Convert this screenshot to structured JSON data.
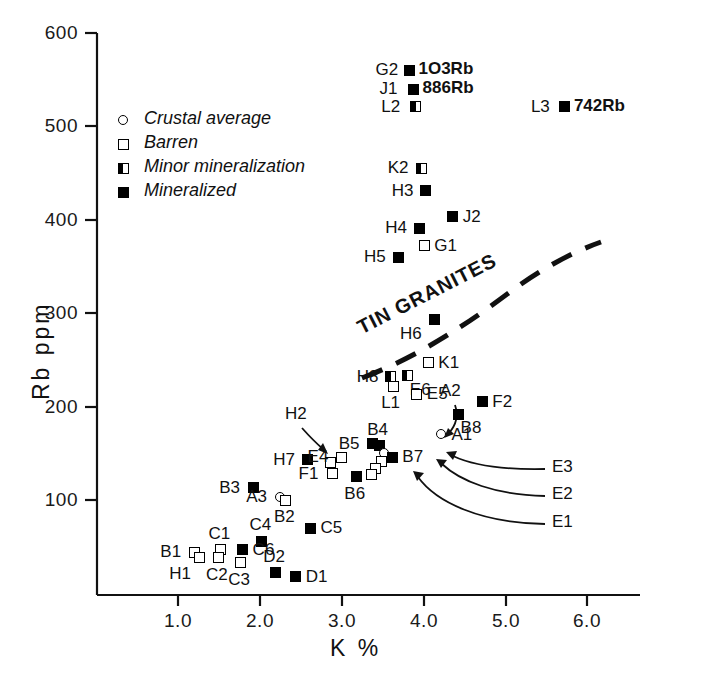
{
  "chart_data": {
    "type": "scatter",
    "title": "",
    "xlabel": "K %",
    "ylabel": "Rb ppm",
    "xlim": [
      0.55,
      6.4
    ],
    "ylim": [
      8,
      600
    ],
    "xticks": [
      1.0,
      2.0,
      3.0,
      4.0,
      5.0,
      6.0
    ],
    "xticklabels": [
      "1.0",
      "2.0",
      "3.0",
      "4.0",
      "5.0",
      "6.0"
    ],
    "yticks": [
      100,
      200,
      300,
      400,
      500,
      600
    ],
    "yticklabels": [
      "100",
      "200",
      "300",
      "400",
      "500",
      "600"
    ],
    "grid": false,
    "legend_position": "upper-left-inside",
    "legend": [
      {
        "key": "crustal",
        "marker": "open-circle",
        "label": "Crustal average"
      },
      {
        "key": "barren",
        "marker": "open-square",
        "label": "Barren"
      },
      {
        "key": "minor",
        "marker": "half-filled-square",
        "label": "Minor mineralization"
      },
      {
        "key": "mineralized",
        "marker": "filled-square",
        "label": "Mineralized"
      }
    ],
    "annotations": [
      {
        "name": "tin-granites-curve-label",
        "text": "TIN  GRANITES",
        "type": "curve-label"
      },
      {
        "name": "tin-granites-boundary",
        "text": "",
        "type": "dashed-curve"
      }
    ],
    "points": [
      {
        "id": "G2",
        "x": 3.83,
        "y": 560,
        "cat": "mineralized",
        "label": "G2",
        "lpos": "left",
        "value": "1O3Rb"
      },
      {
        "id": "J1",
        "x": 3.88,
        "y": 540,
        "cat": "mineralized",
        "label": "J1",
        "lpos": "left",
        "value": "886Rb"
      },
      {
        "id": "L2",
        "x": 3.9,
        "y": 521,
        "cat": "minor",
        "label": "L2",
        "lpos": "left",
        "value": ""
      },
      {
        "id": "L3",
        "x": 5.73,
        "y": 521,
        "cat": "mineralized",
        "label": "L3",
        "lpos": "left",
        "value": "742Rb"
      },
      {
        "id": "K2",
        "x": 3.98,
        "y": 455,
        "cat": "minor",
        "label": "K2",
        "lpos": "left",
        "value": ""
      },
      {
        "id": "H3",
        "x": 4.03,
        "y": 431,
        "cat": "mineralized",
        "label": "H3",
        "lpos": "left",
        "value": ""
      },
      {
        "id": "J2",
        "x": 4.36,
        "y": 403,
        "cat": "mineralized",
        "label": "J2",
        "lpos": "right",
        "value": ""
      },
      {
        "id": "H4",
        "x": 3.95,
        "y": 391,
        "cat": "mineralized",
        "label": "H4",
        "lpos": "left",
        "value": ""
      },
      {
        "id": "G1",
        "x": 4.01,
        "y": 372,
        "cat": "barren",
        "label": "G1",
        "lpos": "right",
        "value": ""
      },
      {
        "id": "H5",
        "x": 3.69,
        "y": 360,
        "cat": "mineralized",
        "label": "H5",
        "lpos": "left",
        "value": ""
      },
      {
        "id": "H6",
        "x": 4.13,
        "y": 293,
        "cat": "mineralized",
        "label": "H6",
        "lpos": "below-left",
        "value": ""
      },
      {
        "id": "K1",
        "x": 4.06,
        "y": 247,
        "cat": "barren",
        "label": "K1",
        "lpos": "right",
        "value": ""
      },
      {
        "id": "H8",
        "x": 3.6,
        "y": 232,
        "cat": "minor",
        "label": "H8",
        "lpos": "left",
        "value": ""
      },
      {
        "id": "L1",
        "x": 3.63,
        "y": 222,
        "cat": "barren",
        "label": "L1",
        "lpos": "below",
        "value": ""
      },
      {
        "id": "E6",
        "x": 3.81,
        "y": 233,
        "cat": "minor",
        "label": "E6",
        "lpos": "below-right",
        "value": ""
      },
      {
        "id": "E5",
        "x": 3.92,
        "y": 213,
        "cat": "barren",
        "label": "E5",
        "lpos": "right",
        "value": ""
      },
      {
        "id": "F2",
        "x": 4.72,
        "y": 205,
        "cat": "mineralized",
        "label": "F2",
        "lpos": "right",
        "value": ""
      },
      {
        "id": "B8",
        "x": 4.43,
        "y": 192,
        "cat": "mineralized",
        "label": "B8",
        "lpos": "below-right",
        "value": ""
      },
      {
        "id": "A1",
        "x": 4.22,
        "y": 170,
        "cat": "crustal",
        "label": "A1",
        "lpos": "right",
        "value": ""
      },
      {
        "id": "B5",
        "x": 3.38,
        "y": 160,
        "cat": "mineralized",
        "label": "B5",
        "lpos": "left",
        "value": ""
      },
      {
        "id": "B4",
        "x": 3.46,
        "y": 158,
        "cat": "mineralized",
        "label": "B4",
        "lpos": "above",
        "value": ""
      },
      {
        "id": "A2",
        "x": 3.52,
        "y": 150,
        "cat": "crustal",
        "label": "A2",
        "lpos": "arrow",
        "value": ""
      },
      {
        "id": "B7",
        "x": 3.62,
        "y": 146,
        "cat": "mineralized",
        "label": "B7",
        "lpos": "right",
        "value": ""
      },
      {
        "id": "E3",
        "x": 3.49,
        "y": 141,
        "cat": "barren",
        "label": "E3",
        "lpos": "arrow",
        "value": ""
      },
      {
        "id": "E2",
        "x": 3.42,
        "y": 134,
        "cat": "barren",
        "label": "E2",
        "lpos": "arrow",
        "value": ""
      },
      {
        "id": "E1",
        "x": 3.36,
        "y": 127,
        "cat": "barren",
        "label": "E1",
        "lpos": "arrow",
        "value": ""
      },
      {
        "id": "H2",
        "x": 2.87,
        "y": 140,
        "cat": "barren",
        "label": "H2",
        "lpos": "arrow",
        "value": ""
      },
      {
        "id": "H7",
        "x": 2.58,
        "y": 143,
        "cat": "mineralized",
        "label": "H7",
        "lpos": "left",
        "value": ""
      },
      {
        "id": "E4",
        "x": 3.0,
        "y": 146,
        "cat": "barren",
        "label": "E4",
        "lpos": "left",
        "value": ""
      },
      {
        "id": "F1",
        "x": 2.89,
        "y": 128,
        "cat": "barren",
        "label": "F1",
        "lpos": "left",
        "value": ""
      },
      {
        "id": "B6",
        "x": 3.18,
        "y": 125,
        "cat": "mineralized",
        "label": "B6",
        "lpos": "below",
        "value": ""
      },
      {
        "id": "B3",
        "x": 1.92,
        "y": 113,
        "cat": "mineralized",
        "label": "B3",
        "lpos": "left",
        "value": ""
      },
      {
        "id": "A3",
        "x": 2.25,
        "y": 103,
        "cat": "crustal",
        "label": "A3",
        "lpos": "left",
        "value": ""
      },
      {
        "id": "B2",
        "x": 2.32,
        "y": 100,
        "cat": "barren",
        "label": "B2",
        "lpos": "below",
        "value": ""
      },
      {
        "id": "C5",
        "x": 2.62,
        "y": 70,
        "cat": "mineralized",
        "label": "C5",
        "lpos": "right",
        "value": ""
      },
      {
        "id": "C4",
        "x": 2.02,
        "y": 56,
        "cat": "mineralized",
        "label": "C4",
        "lpos": "above",
        "value": ""
      },
      {
        "id": "C1",
        "x": 1.52,
        "y": 47,
        "cat": "barren",
        "label": "C1",
        "lpos": "above",
        "value": ""
      },
      {
        "id": "C6",
        "x": 1.79,
        "y": 47,
        "cat": "mineralized",
        "label": "C6",
        "lpos": "right",
        "value": ""
      },
      {
        "id": "B1",
        "x": 1.2,
        "y": 44,
        "cat": "barren",
        "label": "B1",
        "lpos": "left",
        "value": ""
      },
      {
        "id": "H1",
        "x": 1.26,
        "y": 38,
        "cat": "barren",
        "label": "H1",
        "lpos": "below-left",
        "value": ""
      },
      {
        "id": "C2",
        "x": 1.49,
        "y": 38,
        "cat": "barren",
        "label": "C2",
        "lpos": "below",
        "value": ""
      },
      {
        "id": "C3",
        "x": 1.76,
        "y": 33,
        "cat": "barren",
        "label": "C3",
        "lpos": "below",
        "value": ""
      },
      {
        "id": "D2",
        "x": 2.19,
        "y": 22,
        "cat": "mineralized",
        "label": "D2",
        "lpos": "above",
        "value": ""
      },
      {
        "id": "D1",
        "x": 2.44,
        "y": 18,
        "cat": "mineralized",
        "label": "D1",
        "lpos": "right",
        "value": ""
      }
    ]
  }
}
